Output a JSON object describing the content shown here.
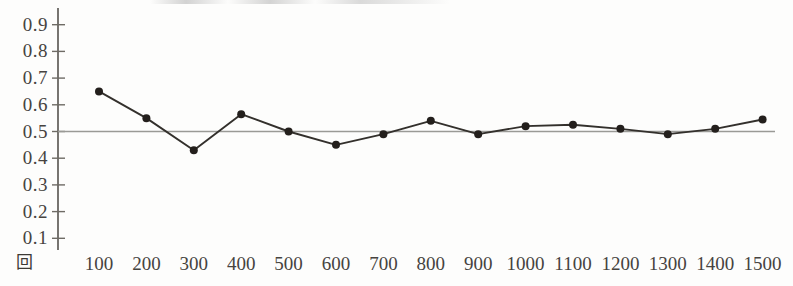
{
  "chart_data": {
    "type": "line",
    "title": "",
    "subtitle": "",
    "xlabel": "回",
    "ylabel": "",
    "x": [
      100,
      200,
      300,
      400,
      500,
      600,
      700,
      800,
      900,
      1000,
      1100,
      1200,
      1300,
      1400,
      1500
    ],
    "values": [
      0.65,
      0.55,
      0.43,
      0.565,
      0.5,
      0.45,
      0.49,
      0.54,
      0.49,
      0.52,
      0.525,
      0.51,
      0.49,
      0.51,
      0.545
    ],
    "series": [
      {
        "name": "",
        "values": [
          0.65,
          0.55,
          0.43,
          0.565,
          0.5,
          0.45,
          0.49,
          0.54,
          0.49,
          0.52,
          0.525,
          0.51,
          0.49,
          0.51,
          0.545
        ]
      }
    ],
    "reference_line": {
      "axis": "y",
      "value": 0.5,
      "color": "#9a9a96"
    },
    "xlim": [
      0,
      1550
    ],
    "ylim": [
      0.0,
      0.95
    ],
    "grid": false,
    "legend": null,
    "marker": "filled-circle",
    "line_color": "#33302c",
    "marker_color": "#231f1c",
    "axis_color": "#6b6862",
    "ytick_labels": [
      "0.9",
      "0.8",
      "0.7",
      "0.6",
      "0.5",
      "0.4",
      "0.3",
      "0.2",
      "0.1"
    ],
    "ytick_values": [
      0.9,
      0.8,
      0.7,
      0.6,
      0.5,
      0.4,
      0.3,
      0.2,
      0.1
    ],
    "xtick_labels": [
      "100",
      "200",
      "300",
      "400",
      "500",
      "600",
      "700",
      "800",
      "900",
      "1000",
      "1100",
      "1200",
      "1300",
      "1400",
      "1500"
    ],
    "xtick_values": [
      100,
      200,
      300,
      400,
      500,
      600,
      700,
      800,
      900,
      1000,
      1100,
      1200,
      1300,
      1400,
      1500
    ]
  },
  "axis": {
    "x_axis_name": "回"
  }
}
